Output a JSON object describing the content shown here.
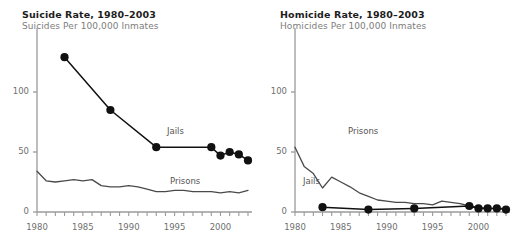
{
  "chart_data": [
    {
      "type": "line",
      "title": "Suicide Rate, 1980–2003",
      "subtitle": "Suicides Per 100,000 Inmates",
      "xlabel": "",
      "ylabel": "",
      "xlim": [
        1980,
        2003
      ],
      "ylim": [
        0,
        140
      ],
      "yticks": [
        0,
        50,
        100
      ],
      "ytick_labels": [
        "0",
        "50",
        "100"
      ],
      "xticks": [
        1980,
        1981,
        1982,
        1983,
        1984,
        1985,
        1986,
        1987,
        1988,
        1989,
        1990,
        1991,
        1992,
        1993,
        1994,
        1995,
        1996,
        1997,
        1998,
        1999,
        2000,
        2001,
        2002,
        2003
      ],
      "xtick_labels": [
        "1980",
        "1985",
        "1990",
        "1995",
        "2000"
      ],
      "xtick_label_years": [
        1980,
        1985,
        1990,
        1995,
        2000
      ],
      "grid": false,
      "legend_position": "inline-annotation",
      "series": [
        {
          "name": "Jails",
          "style": "line-markers",
          "color": "#111111",
          "annotation": "Jails",
          "x": [
            1983,
            1988,
            1993,
            1999,
            2000,
            2001,
            2002,
            2003
          ],
          "values": [
            129,
            85,
            54,
            54,
            47,
            50,
            48,
            43
          ]
        },
        {
          "name": "Prisons",
          "style": "line",
          "color": "#4a4a4a",
          "annotation": "Prisons",
          "x": [
            1980,
            1981,
            1982,
            1983,
            1984,
            1985,
            1986,
            1987,
            1988,
            1989,
            1990,
            1991,
            1992,
            1993,
            1994,
            1995,
            1996,
            1997,
            1998,
            1999,
            2000,
            2001,
            2002,
            2003
          ],
          "values": [
            34,
            26,
            25,
            26,
            27,
            26,
            27,
            22,
            21,
            21,
            22,
            21,
            19,
            17,
            17,
            18,
            18,
            17,
            17,
            17,
            16,
            17,
            16,
            18
          ]
        }
      ]
    },
    {
      "type": "line",
      "title": "Homicide Rate, 1980–2003",
      "subtitle": "Homicides Per 100,000 Inmates",
      "xlabel": "",
      "ylabel": "",
      "xlim": [
        1980,
        2003
      ],
      "ylim": [
        0,
        140
      ],
      "yticks": [
        0,
        50,
        100
      ],
      "ytick_labels": [
        "0",
        "50",
        "100"
      ],
      "xticks": [
        1980,
        1981,
        1982,
        1983,
        1984,
        1985,
        1986,
        1987,
        1988,
        1989,
        1990,
        1991,
        1992,
        1993,
        1994,
        1995,
        1996,
        1997,
        1998,
        1999,
        2000,
        2001,
        2002,
        2003
      ],
      "xtick_labels": [
        "1980",
        "1985",
        "1990",
        "1995",
        "2000"
      ],
      "xtick_label_years": [
        1980,
        1985,
        1990,
        1995,
        2000
      ],
      "grid": false,
      "legend_position": "inline-annotation",
      "series": [
        {
          "name": "Prisons",
          "style": "line",
          "color": "#4a4a4a",
          "annotation": "Prisons",
          "x": [
            1980,
            1981,
            1982,
            1983,
            1984,
            1985,
            1986,
            1987,
            1988,
            1989,
            1990,
            1991,
            1992,
            1993,
            1994,
            1995,
            1996,
            1997,
            1998,
            1999,
            2000,
            2001,
            2002,
            2003
          ],
          "values": [
            54,
            38,
            32,
            20,
            29,
            25,
            21,
            16,
            13,
            10,
            9,
            8,
            8,
            7,
            7,
            6,
            9,
            8,
            7,
            5,
            4,
            3,
            3,
            3
          ]
        },
        {
          "name": "Jails",
          "style": "line-markers",
          "color": "#111111",
          "annotation": "Jails",
          "x": [
            1983,
            1988,
            1993,
            1999,
            2000,
            2001,
            2002,
            2003
          ],
          "values": [
            4,
            2,
            3,
            5,
            3,
            3,
            3,
            2
          ]
        }
      ]
    }
  ]
}
